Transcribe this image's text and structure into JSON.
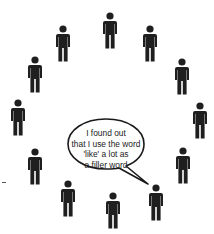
{
  "diagram": {
    "title": "",
    "people_count": 13,
    "people": [
      {
        "id": 1,
        "x": 102,
        "y": 12
      },
      {
        "id": 2,
        "x": 55,
        "y": 25
      },
      {
        "id": 3,
        "x": 142,
        "y": 25
      },
      {
        "id": 4,
        "x": 27,
        "y": 56
      },
      {
        "id": 5,
        "x": 174,
        "y": 58
      },
      {
        "id": 6,
        "x": 10,
        "y": 99
      },
      {
        "id": 7,
        "x": 192,
        "y": 102
      },
      {
        "id": 8,
        "x": 27,
        "y": 148
      },
      {
        "id": 9,
        "x": 175,
        "y": 147
      },
      {
        "id": 10,
        "x": 60,
        "y": 180
      },
      {
        "id": 11,
        "x": 148,
        "y": 184
      },
      {
        "id": 12,
        "x": 105,
        "y": 192
      }
    ],
    "speech_bubble": {
      "text_lines": [
        "I found out",
        "that I use the word",
        "'like' a lot as",
        "a filler word"
      ],
      "speaker_id": 11
    },
    "colors": {
      "figure": "#1f1f1f",
      "bubble_stroke": "#1a1a1a",
      "background": "#ffffff"
    }
  }
}
